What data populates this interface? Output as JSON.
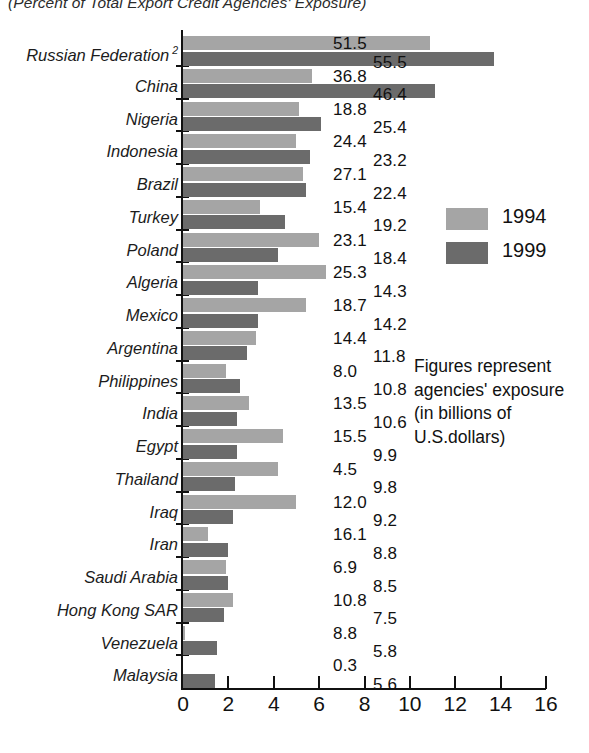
{
  "chart_data": {
    "type": "bar",
    "orientation": "horizontal",
    "title": "(Percent of Total Export Credit Agencies' Exposure)",
    "xlabel": "",
    "ylabel": "",
    "xlim": [
      0,
      16
    ],
    "xticks": [
      0,
      2,
      4,
      6,
      8,
      10,
      12,
      14,
      16
    ],
    "xtick_labels": [
      "0",
      "2",
      "4",
      "6",
      "8",
      "10",
      "12",
      "14",
      "16"
    ],
    "grid": false,
    "legend_position": "right",
    "categories": [
      "Russian Federation",
      "China",
      "Nigeria",
      "Indonesia",
      "Brazil",
      "Turkey",
      "Poland",
      "Algeria",
      "Mexico",
      "Argentina",
      "Philippines",
      "India",
      "Egypt",
      "Thailand",
      "Iraq",
      "Iran",
      "Saudi Arabia",
      "Hong Kong SAR",
      "Venezuela",
      "Malaysia"
    ],
    "series": [
      {
        "name": "1994",
        "color": "#a5a5a5",
        "values": [
          10.9,
          5.7,
          5.1,
          5.0,
          5.3,
          3.4,
          6.0,
          6.3,
          5.4,
          3.2,
          1.9,
          2.9,
          4.4,
          4.2,
          5.0,
          1.1,
          1.9,
          2.2,
          0.1,
          0.0
        ]
      },
      {
        "name": "1999",
        "color": "#6b6b6b",
        "values": [
          13.7,
          11.1,
          6.1,
          5.6,
          5.4,
          4.5,
          4.2,
          3.3,
          3.3,
          2.8,
          2.5,
          2.4,
          2.4,
          2.3,
          2.2,
          2.0,
          2.0,
          1.8,
          1.5,
          1.4
        ]
      }
    ],
    "data_labels": {
      "1994": [
        "51.5",
        "36.8",
        "18.8",
        "24.4",
        "27.1",
        "15.4",
        "23.1",
        "25.3",
        "18.7",
        "14.4",
        "8.0",
        "13.5",
        "15.5",
        "4.5",
        "12.0",
        "16.1",
        "6.9",
        "10.8",
        "8.8",
        "0.3"
      ],
      "1999": [
        "55.5",
        "46.4",
        "25.4",
        "23.2",
        "22.4",
        "19.2",
        "18.4",
        "14.3",
        "14.2",
        "11.8",
        "10.8",
        "10.6",
        "9.9",
        "9.8",
        "9.2",
        "8.8",
        "8.5",
        "7.5",
        "5.8",
        "5.6"
      ]
    },
    "category_footnotes": {
      "Russian Federation": "2"
    },
    "annotation_lines": [
      "Figures represent",
      "agencies' exposure",
      "(in billions of",
      "U.S.dollars)"
    ],
    "legend_entries": [
      {
        "label": "1994",
        "color": "#a5a5a5"
      },
      {
        "label": "1999",
        "color": "#6b6b6b"
      }
    ]
  }
}
